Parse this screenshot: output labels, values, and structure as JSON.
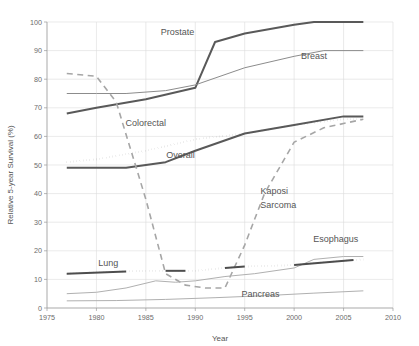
{
  "chart_data": {
    "type": "line",
    "title": "",
    "xlabel": "Year",
    "ylabel": "Relative 5-year Survival (%)",
    "xlim": [
      1975,
      2010
    ],
    "ylim": [
      0,
      100
    ],
    "xticks": [
      1975,
      1980,
      1985,
      1990,
      1995,
      2000,
      2005,
      2010
    ],
    "yticks": [
      0,
      10,
      20,
      30,
      40,
      50,
      60,
      70,
      80,
      90,
      100
    ],
    "grid": true,
    "legend": "inline-annotations",
    "series": [
      {
        "name": "Prostate",
        "style": "solid",
        "color": "#595959",
        "width": 2.0,
        "x": [
          1977,
          1980,
          1985,
          1990,
          1992,
          1995,
          2000,
          2002,
          2007
        ],
        "values": [
          68,
          70,
          73,
          77,
          93,
          96,
          99,
          100,
          100
        ]
      },
      {
        "name": "Breast",
        "style": "solid-thin",
        "color": "#8c8c8c",
        "width": 1.0,
        "x": [
          1977,
          1980,
          1983,
          1987,
          1990,
          1995,
          2000,
          2003,
          2007
        ],
        "values": [
          75,
          75,
          75,
          76,
          78,
          84,
          88,
          90,
          90
        ]
      },
      {
        "name": "Colorectal",
        "style": "dotted",
        "color": "#4d4d4d",
        "width": 2.0,
        "x": [
          1977,
          1980,
          1985,
          1990,
          1995,
          2000,
          2005,
          2007
        ],
        "values": [
          51,
          52,
          55,
          59,
          61,
          64,
          66,
          66
        ]
      },
      {
        "name": "Overall",
        "style": "solid",
        "color": "#595959",
        "width": 2.0,
        "x": [
          1977,
          1980,
          1983,
          1987,
          1990,
          1995,
          2000,
          2005,
          2007
        ],
        "values": [
          49,
          49,
          49,
          51,
          55,
          61,
          64,
          67,
          67
        ]
      },
      {
        "name": "Kaposi Sarcoma",
        "style": "dashed",
        "color": "#a6a6a6",
        "width": 1.6,
        "x": [
          1977,
          1980,
          1982,
          1985,
          1987,
          1989,
          1991,
          1993,
          1995,
          1997,
          2000,
          2003,
          2007
        ],
        "values": [
          82,
          81,
          72,
          38,
          12,
          8,
          7,
          7,
          22,
          40,
          58,
          63,
          66
        ]
      },
      {
        "name": "Lung",
        "style": "dotted-dark",
        "color": "#4d4d4d",
        "width": 2.0,
        "x": [
          1977,
          1980,
          1985,
          1987,
          1990,
          1993,
          1995,
          2000,
          2003,
          2007
        ],
        "values": [
          12,
          12.5,
          13,
          13,
          13,
          14,
          14.5,
          15,
          16,
          17
        ]
      },
      {
        "name": "Esophagus",
        "style": "solid-thin",
        "color": "#b0b0b0",
        "width": 1.0,
        "x": [
          1977,
          1980,
          1983,
          1986,
          1988,
          1990,
          1993,
          1996,
          2000,
          2002,
          2005,
          2007
        ],
        "values": [
          5,
          5.5,
          7,
          9.5,
          9,
          9.5,
          11,
          12,
          14,
          17,
          18,
          18
        ]
      },
      {
        "name": "Pancreas",
        "style": "solid-thin",
        "color": "#b0b0b0",
        "width": 1.0,
        "x": [
          1977,
          1982,
          1987,
          1992,
          1997,
          2002,
          2007
        ],
        "values": [
          2.5,
          2.6,
          3,
          3.6,
          4.3,
          5.2,
          6
        ]
      }
    ],
    "annotations": [
      {
        "text": "Prostate",
        "x": 1988.2,
        "y": 95.5,
        "anchor": "middle"
      },
      {
        "text": "Breast",
        "x": 2002.0,
        "y": 87.0,
        "anchor": "middle"
      },
      {
        "text": "Colorectal",
        "x": 1985.0,
        "y": 63.5,
        "anchor": "middle"
      },
      {
        "text": "Overall",
        "x": 1988.5,
        "y": 52.5,
        "anchor": "middle"
      },
      {
        "text": "Kaposi",
        "x": 1998.0,
        "y": 40.0,
        "anchor": "middle"
      },
      {
        "text": "Sarcoma",
        "x": 1998.4,
        "y": 35.0,
        "anchor": "middle"
      },
      {
        "text": "Esophagus",
        "x": 2004.2,
        "y": 23.0,
        "anchor": "middle"
      },
      {
        "text": "Lung",
        "x": 1981.2,
        "y": 14.8,
        "anchor": "middle"
      },
      {
        "text": "Pancreas",
        "x": 1996.6,
        "y": 3.9,
        "anchor": "middle"
      }
    ]
  }
}
